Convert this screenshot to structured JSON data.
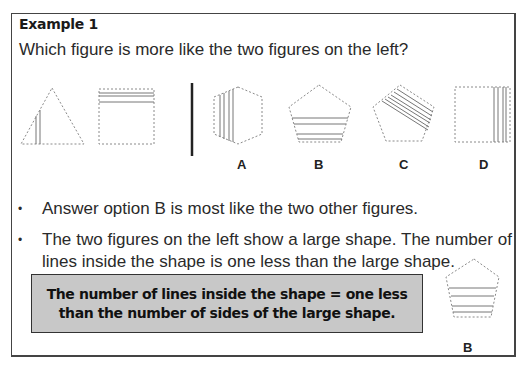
{
  "heading": "Example 1",
  "question": "Which figure is more like the two figures on the left?",
  "example_figures": [
    {
      "shape": "triangle",
      "sides": 3,
      "inner_lines": 2
    },
    {
      "shape": "square",
      "sides": 4,
      "inner_lines": 3
    }
  ],
  "options": [
    {
      "label": "A",
      "shape": "hexagon",
      "sides": 6,
      "inner_lines": 4
    },
    {
      "label": "B",
      "shape": "pentagon",
      "sides": 5,
      "inner_lines": 4
    },
    {
      "label": "C",
      "shape": "pentagon",
      "sides": 5,
      "inner_lines": 6
    },
    {
      "label": "D",
      "shape": "square",
      "sides": 4,
      "inner_lines": 4
    }
  ],
  "bullets": [
    "Answer option B is most like the two other figures.",
    "The two figures on the left show a large shape. The number of lines inside the shape is one less than the large shape."
  ],
  "bullet_glyph": "•",
  "rule": "The number of lines inside the shape = one less than the number of sides of the large shape.",
  "answer_label": "B",
  "colors": {
    "border": "#444444",
    "rule_box_bg": "#c8c8c8",
    "dashed_outline": "#8a8a8a",
    "inner_line": "#777777"
  }
}
